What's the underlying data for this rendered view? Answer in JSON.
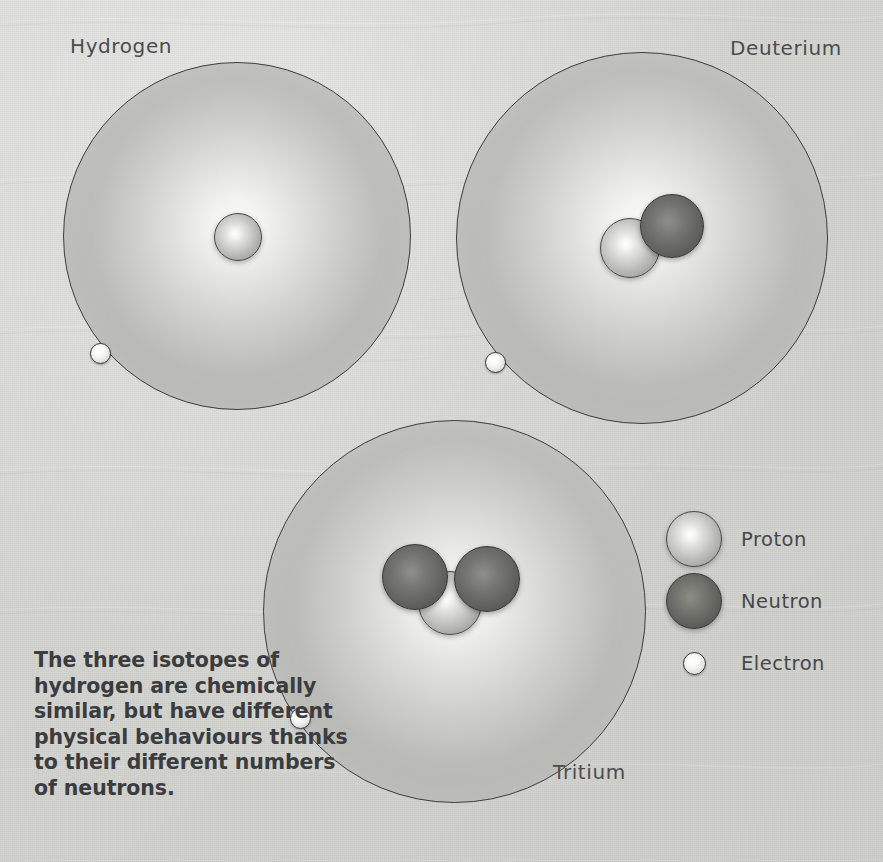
{
  "figure": {
    "background_color": "#d6d7d3",
    "caption": "The three isotopes of hydrogen are chemically similar, but have different physical behaviours thanks to their different numbers of neutrons."
  },
  "atoms": [
    {
      "id": "hydrogen",
      "label": "Hydrogen",
      "protons": 1,
      "neutrons": 0,
      "electrons": 1
    },
    {
      "id": "deuterium",
      "label": "Deuterium",
      "protons": 1,
      "neutrons": 1,
      "electrons": 1
    },
    {
      "id": "tritium",
      "label": "Tritium",
      "protons": 1,
      "neutrons": 2,
      "electrons": 1
    }
  ],
  "legend": {
    "items": [
      {
        "icon": "proton-sphere-icon",
        "label": "Proton",
        "color": "#e0e0db"
      },
      {
        "icon": "neutron-sphere-icon",
        "label": "Neutron",
        "color": "#6a6b66"
      },
      {
        "icon": "electron-dot-icon",
        "label": "Electron",
        "color": "#f6f6f3"
      }
    ]
  }
}
